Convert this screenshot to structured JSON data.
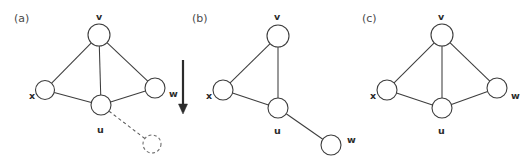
{
  "figure": {
    "width": 529,
    "height": 163,
    "background_color": "#ffffff",
    "line_color": "#3d3d3d",
    "label_color": "#2b2b2b"
  },
  "panels": [
    {
      "id": "a",
      "label": "(a)",
      "label_x": 14,
      "label_y": 22,
      "nodes": [
        {
          "id": "v",
          "label": "v",
          "cx": 99,
          "cy": 35,
          "r": 11,
          "style": "solid",
          "label_x": 96,
          "label_y": 20
        },
        {
          "id": "x",
          "label": "x",
          "cx": 45,
          "cy": 90,
          "r": 9.5,
          "style": "solid",
          "label_x": 29,
          "label_y": 99
        },
        {
          "id": "w",
          "label": "w",
          "cx": 155,
          "cy": 88,
          "r": 10,
          "style": "solid",
          "label_x": 169,
          "label_y": 97
        },
        {
          "id": "u",
          "label": "u",
          "cx": 101,
          "cy": 105,
          "r": 10,
          "style": "solid",
          "label_x": 97,
          "label_y": 133
        },
        {
          "id": "ghost",
          "label": "",
          "cx": 152,
          "cy": 144,
          "r": 9,
          "style": "dashed",
          "label_x": 0,
          "label_y": 0
        }
      ],
      "edges": [
        {
          "from": "v",
          "to": "x",
          "style": "solid"
        },
        {
          "from": "v",
          "to": "w",
          "style": "solid"
        },
        {
          "from": "v",
          "to": "u",
          "style": "solid"
        },
        {
          "from": "x",
          "to": "u",
          "style": "solid"
        },
        {
          "from": "u",
          "to": "w",
          "style": "solid"
        },
        {
          "from": "u",
          "to": "ghost",
          "style": "dashed"
        }
      ]
    },
    {
      "id": "b",
      "label": "(b)",
      "label_x": 192,
      "label_y": 22,
      "nodes": [
        {
          "id": "v",
          "label": "v",
          "cx": 278,
          "cy": 36,
          "r": 11,
          "style": "solid",
          "label_x": 274,
          "label_y": 20
        },
        {
          "id": "x",
          "label": "x",
          "cx": 223,
          "cy": 90,
          "r": 10,
          "style": "solid",
          "label_x": 206,
          "label_y": 99
        },
        {
          "id": "u",
          "label": "u",
          "cx": 278,
          "cy": 108,
          "r": 10,
          "style": "solid",
          "label_x": 274,
          "label_y": 134
        },
        {
          "id": "w",
          "label": "w",
          "cx": 331,
          "cy": 145,
          "r": 10,
          "style": "solid",
          "label_x": 347,
          "label_y": 143
        }
      ],
      "edges": [
        {
          "from": "v",
          "to": "x",
          "style": "solid"
        },
        {
          "from": "v",
          "to": "u",
          "style": "solid"
        },
        {
          "from": "x",
          "to": "u",
          "style": "solid"
        },
        {
          "from": "u",
          "to": "w",
          "style": "solid"
        }
      ]
    },
    {
      "id": "c",
      "label": "(c)",
      "label_x": 362,
      "label_y": 22,
      "nodes": [
        {
          "id": "v",
          "label": "v",
          "cx": 442,
          "cy": 35,
          "r": 11,
          "style": "solid",
          "label_x": 438,
          "label_y": 20
        },
        {
          "id": "x",
          "label": "x",
          "cx": 387,
          "cy": 90,
          "r": 10,
          "style": "solid",
          "label_x": 370,
          "label_y": 99
        },
        {
          "id": "w",
          "label": "w",
          "cx": 497,
          "cy": 88,
          "r": 10,
          "style": "solid",
          "label_x": 511,
          "label_y": 99
        },
        {
          "id": "u",
          "label": "u",
          "cx": 442,
          "cy": 108,
          "r": 10,
          "style": "solid",
          "label_x": 438,
          "label_y": 134
        }
      ],
      "edges": [
        {
          "from": "v",
          "to": "x",
          "style": "solid"
        },
        {
          "from": "v",
          "to": "w",
          "style": "solid"
        },
        {
          "from": "v",
          "to": "u",
          "style": "solid"
        },
        {
          "from": "x",
          "to": "u",
          "style": "solid"
        },
        {
          "from": "u",
          "to": "w",
          "style": "solid"
        }
      ]
    }
  ],
  "arrow": {
    "name": "down-arrow",
    "x": 183,
    "y_start": 60,
    "y_end": 104,
    "head_width": 9,
    "head_length": 10,
    "color": "#2b2b2b"
  }
}
